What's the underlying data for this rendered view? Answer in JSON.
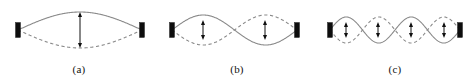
{
  "figure": {
    "background_color": "#ffffff",
    "width": 474,
    "height": 84,
    "wave_color": "#8a8a8a",
    "support_color": "#0d0d0d",
    "arrow_color": "#101010",
    "baseline_y": 30
  },
  "panels": [
    {
      "id": "panel-a",
      "caption": "(a)",
      "x": 0,
      "width": 158,
      "string_left_x": 18,
      "string_right_x": 142,
      "harmonic": 1,
      "loops": 1,
      "amplitude": 18,
      "antinode_arrows": [
        {
          "x": 80,
          "top_y": 12,
          "bottom_y": 48
        }
      ],
      "nodes_x": [
        18,
        142
      ],
      "curves": [
        {
          "style": "solid",
          "phase": "positive"
        },
        {
          "style": "dashed",
          "phase": "negative"
        }
      ]
    },
    {
      "id": "panel-b",
      "caption": "(b)",
      "x": 158,
      "width": 158,
      "string_left_x": 14,
      "string_right_x": 139,
      "harmonic": 2,
      "loops": 2,
      "amplitude": 15,
      "antinode_arrows": [
        {
          "x": 45,
          "top_y": 20,
          "bottom_y": 40
        },
        {
          "x": 107,
          "top_y": 20,
          "bottom_y": 40
        }
      ],
      "nodes_x": [
        14,
        76,
        139
      ],
      "curves": [
        {
          "style": "solid",
          "phase": "positive"
        },
        {
          "style": "dashed",
          "phase": "negative"
        }
      ]
    },
    {
      "id": "panel-c",
      "caption": "(c)",
      "x": 316,
      "width": 158,
      "string_left_x": 14,
      "string_right_x": 144,
      "harmonic": 4,
      "loops": 4,
      "amplitude": 13,
      "antinode_arrows": [
        {
          "x": 30,
          "top_y": 22,
          "bottom_y": 38
        },
        {
          "x": 62,
          "top_y": 22,
          "bottom_y": 38
        },
        {
          "x": 95,
          "top_y": 22,
          "bottom_y": 38
        },
        {
          "x": 128,
          "top_y": 22,
          "bottom_y": 38
        }
      ],
      "nodes_x": [
        14,
        47,
        79,
        112,
        144
      ],
      "curves": [
        {
          "style": "solid",
          "phase": "positive"
        },
        {
          "style": "dashed",
          "phase": "negative"
        }
      ]
    }
  ],
  "support": {
    "width": 5,
    "height": 15,
    "shape": "rectangle"
  },
  "arrow": {
    "head_width": 4,
    "head_length": 5,
    "type": "double-headed-vertical"
  }
}
